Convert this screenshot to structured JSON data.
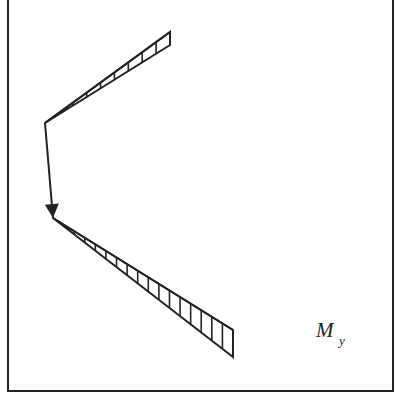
{
  "diagram": {
    "type": "bending-moment-diagram",
    "label": {
      "main": "M",
      "subscript": "y"
    },
    "colors": {
      "stroke": "#222222",
      "background": "#ffffff"
    },
    "frame": {
      "x1": 8,
      "y1": -2,
      "x2": 393,
      "y2": 391
    },
    "member_path": [
      [
        170,
        32
      ],
      [
        45,
        123
      ],
      [
        53,
        218
      ],
      [
        233,
        330
      ]
    ],
    "arrow": {
      "from": [
        45,
        123
      ],
      "to": [
        53,
        218
      ]
    },
    "top_band": {
      "apex": [
        45,
        123
      ],
      "outer_end": [
        170,
        32
      ],
      "inner_end": [
        170,
        45
      ],
      "hatch_count": 9
    },
    "bottom_band": {
      "apex": [
        53,
        218
      ],
      "outer_end": [
        233,
        330
      ],
      "inner_end": [
        233,
        357
      ],
      "hatch_count": 17
    }
  }
}
